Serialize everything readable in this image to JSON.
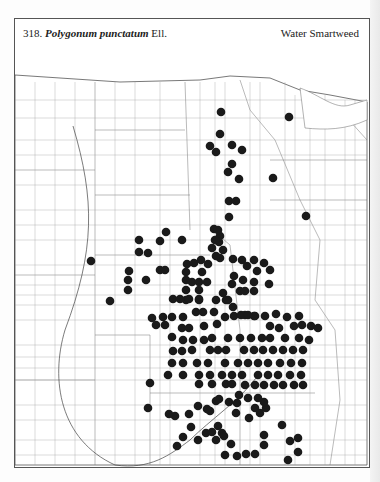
{
  "header": {
    "number": "318.",
    "species": "Polygonum punctatum",
    "author": "Ell.",
    "common_name": "Water Smartweed"
  },
  "map": {
    "dot_color": "#1a1a1a",
    "line_color": "#666666",
    "dot_radius": 4.3,
    "dots": [
      [
        289,
        117
      ],
      [
        221,
        112
      ],
      [
        220,
        134
      ],
      [
        210,
        146
      ],
      [
        232,
        145
      ],
      [
        216,
        152
      ],
      [
        242,
        150
      ],
      [
        273,
        178
      ],
      [
        232,
        164
      ],
      [
        228,
        172
      ],
      [
        239,
        179
      ],
      [
        306,
        216
      ],
      [
        229,
        201
      ],
      [
        236,
        201
      ],
      [
        229,
        217
      ],
      [
        214,
        229
      ],
      [
        220,
        236
      ],
      [
        218,
        230
      ],
      [
        139,
        240
      ],
      [
        166,
        232
      ],
      [
        160,
        241
      ],
      [
        182,
        240
      ],
      [
        91,
        261
      ],
      [
        139,
        252
      ],
      [
        148,
        253
      ],
      [
        129,
        271
      ],
      [
        160,
        270
      ],
      [
        110,
        301
      ],
      [
        128,
        280
      ],
      [
        128,
        290
      ],
      [
        146,
        280
      ],
      [
        165,
        270
      ],
      [
        212,
        248
      ],
      [
        219,
        242
      ],
      [
        215,
        240
      ],
      [
        223,
        250
      ],
      [
        220,
        258
      ],
      [
        216,
        256
      ],
      [
        187,
        264
      ],
      [
        194,
        263
      ],
      [
        201,
        260
      ],
      [
        208,
        264
      ],
      [
        186,
        272
      ],
      [
        202,
        272
      ],
      [
        233,
        259
      ],
      [
        242,
        260
      ],
      [
        247,
        266
      ],
      [
        254,
        260
      ],
      [
        257,
        271
      ],
      [
        264,
        263
      ],
      [
        270,
        270
      ],
      [
        234,
        276
      ],
      [
        243,
        280
      ],
      [
        254,
        282
      ],
      [
        240,
        291
      ],
      [
        245,
        291
      ],
      [
        254,
        291
      ],
      [
        269,
        284
      ],
      [
        186,
        280
      ],
      [
        192,
        282
      ],
      [
        199,
        282
      ],
      [
        207,
        282
      ],
      [
        186,
        290
      ],
      [
        199,
        290
      ],
      [
        186,
        300
      ],
      [
        199,
        300
      ],
      [
        232,
        284
      ],
      [
        223,
        293
      ],
      [
        216,
        300
      ],
      [
        226,
        300
      ],
      [
        233,
        307
      ],
      [
        173,
        299
      ],
      [
        180,
        299
      ],
      [
        189,
        299
      ],
      [
        199,
        299
      ],
      [
        228,
        300
      ],
      [
        152,
        318
      ],
      [
        163,
        317
      ],
      [
        172,
        317
      ],
      [
        183,
        317
      ],
      [
        196,
        312
      ],
      [
        203,
        312
      ],
      [
        214,
        312
      ],
      [
        225,
        317
      ],
      [
        234,
        316
      ],
      [
        245,
        315
      ],
      [
        255,
        316
      ],
      [
        265,
        316
      ],
      [
        276,
        314
      ],
      [
        287,
        317
      ],
      [
        299,
        316
      ],
      [
        156,
        325
      ],
      [
        165,
        325
      ],
      [
        182,
        328
      ],
      [
        189,
        328
      ],
      [
        204,
        326
      ],
      [
        217,
        324
      ],
      [
        241,
        315
      ],
      [
        248,
        315
      ],
      [
        254,
        316
      ],
      [
        270,
        326
      ],
      [
        279,
        328
      ],
      [
        294,
        326
      ],
      [
        302,
        325
      ],
      [
        311,
        326
      ],
      [
        318,
        328
      ],
      [
        309,
        340
      ],
      [
        299,
        338
      ],
      [
        285,
        338
      ],
      [
        270,
        338
      ],
      [
        262,
        338
      ],
      [
        251,
        338
      ],
      [
        240,
        338
      ],
      [
        228,
        338
      ],
      [
        212,
        338
      ],
      [
        204,
        340
      ],
      [
        193,
        340
      ],
      [
        183,
        340
      ],
      [
        172,
        337
      ],
      [
        173,
        351
      ],
      [
        182,
        351
      ],
      [
        192,
        350
      ],
      [
        210,
        350
      ],
      [
        218,
        350
      ],
      [
        226,
        350
      ],
      [
        244,
        350
      ],
      [
        254,
        350
      ],
      [
        263,
        350
      ],
      [
        273,
        350
      ],
      [
        283,
        350
      ],
      [
        293,
        350
      ],
      [
        303,
        350
      ],
      [
        172,
        363
      ],
      [
        183,
        363
      ],
      [
        197,
        363
      ],
      [
        208,
        363
      ],
      [
        225,
        363
      ],
      [
        238,
        363
      ],
      [
        248,
        363
      ],
      [
        258,
        363
      ],
      [
        268,
        363
      ],
      [
        280,
        363
      ],
      [
        291,
        363
      ],
      [
        302,
        363
      ],
      [
        183,
        375
      ],
      [
        199,
        375
      ],
      [
        210,
        375
      ],
      [
        222,
        375
      ],
      [
        232,
        375
      ],
      [
        242,
        375
      ],
      [
        258,
        375
      ],
      [
        268,
        375
      ],
      [
        278,
        375
      ],
      [
        290,
        375
      ],
      [
        301,
        375
      ],
      [
        168,
        375
      ],
      [
        245,
        385
      ],
      [
        255,
        385
      ],
      [
        264,
        385
      ],
      [
        274,
        385
      ],
      [
        283,
        385
      ],
      [
        294,
        385
      ],
      [
        303,
        385
      ],
      [
        199,
        384
      ],
      [
        212,
        384
      ],
      [
        226,
        384
      ],
      [
        232,
        384
      ],
      [
        148,
        408
      ],
      [
        150,
        383
      ],
      [
        175,
        416
      ],
      [
        169,
        414
      ],
      [
        189,
        414
      ],
      [
        198,
        406
      ],
      [
        207,
        409
      ],
      [
        210,
        411
      ],
      [
        216,
        401
      ],
      [
        219,
        399
      ],
      [
        229,
        402
      ],
      [
        237,
        403
      ],
      [
        255,
        408
      ],
      [
        260,
        413
      ],
      [
        266,
        408
      ],
      [
        264,
        402
      ],
      [
        236,
        413
      ],
      [
        264,
        435
      ],
      [
        282,
        425
      ],
      [
        249,
        418
      ],
      [
        258,
        398
      ],
      [
        248,
        398
      ],
      [
        239,
        395
      ],
      [
        191,
        427
      ],
      [
        183,
        437
      ],
      [
        177,
        446
      ],
      [
        206,
        433
      ],
      [
        212,
        432
      ],
      [
        218,
        426
      ],
      [
        222,
        433
      ],
      [
        216,
        440
      ],
      [
        224,
        436
      ],
      [
        231,
        444
      ],
      [
        237,
        456
      ],
      [
        255,
        454
      ],
      [
        225,
        455
      ],
      [
        246,
        454
      ],
      [
        290,
        441
      ],
      [
        298,
        438
      ],
      [
        298,
        452
      ],
      [
        288,
        460
      ],
      [
        264,
        445
      ],
      [
        198,
        440
      ]
    ]
  }
}
